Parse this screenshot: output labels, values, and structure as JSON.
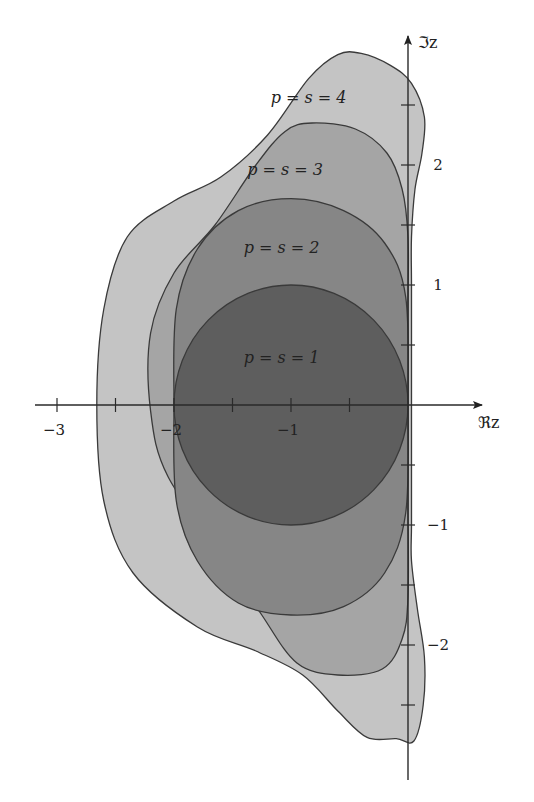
{
  "chart_data": {
    "type": "area",
    "title": "",
    "xlabel": "ℜz",
    "ylabel": "ℑz",
    "xlim": [
      -3.2,
      1.0
    ],
    "ylim": [
      -3.1,
      3.1
    ],
    "x_ticks": [
      -3,
      -2.5,
      -2,
      -1.5,
      -1,
      -0.5,
      0
    ],
    "x_tick_labels": [
      {
        "value": -3,
        "label": "−3"
      },
      {
        "value": -2,
        "label": "−2"
      },
      {
        "value": -1,
        "label": "−1"
      }
    ],
    "y_ticks": [
      -2.5,
      -2,
      -1.5,
      -1,
      -0.5,
      0.5,
      1,
      1.5,
      2,
      2.5
    ],
    "y_tick_labels": [
      {
        "value": 2,
        "label": "2"
      },
      {
        "value": 1,
        "label": "1"
      },
      {
        "value": -1,
        "label": "−1"
      },
      {
        "value": -2,
        "label": "−2"
      }
    ],
    "grid": false,
    "series": [
      {
        "name": "p = s = 4",
        "label": "p = s = 4",
        "fill": "#c4c4c4",
        "label_at": [
          -0.85,
          2.52
        ],
        "outline": [
          [
            -0.4,
            2.93
          ],
          [
            -0.15,
            2.83
          ],
          [
            0.03,
            2.68
          ],
          [
            0.14,
            2.4
          ],
          [
            0.12,
            2.1
          ],
          [
            0.06,
            1.8
          ],
          [
            0.03,
            1.4
          ],
          [
            0.03,
            1.0
          ],
          [
            0.03,
            0.4
          ],
          [
            0.03,
            -0.4
          ],
          [
            0.03,
            -1.0
          ],
          [
            0.03,
            -1.3
          ],
          [
            0.08,
            -1.7
          ],
          [
            0.14,
            -2.1
          ],
          [
            0.13,
            -2.5
          ],
          [
            0.05,
            -2.8
          ],
          [
            -0.1,
            -2.78
          ],
          [
            -0.35,
            -2.77
          ],
          [
            -0.6,
            -2.55
          ],
          [
            -0.9,
            -2.25
          ],
          [
            -1.3,
            -2.05
          ],
          [
            -1.8,
            -1.85
          ],
          [
            -2.35,
            -1.4
          ],
          [
            -2.6,
            -0.8
          ],
          [
            -2.66,
            0.0
          ],
          [
            -2.6,
            0.8
          ],
          [
            -2.4,
            1.4
          ],
          [
            -2.0,
            1.7
          ],
          [
            -1.6,
            1.9
          ],
          [
            -1.2,
            2.25
          ],
          [
            -0.85,
            2.72
          ],
          [
            -0.6,
            2.92
          ]
        ]
      },
      {
        "name": "p = s = 3",
        "label": "p = s = 3",
        "fill": "#a5a5a5",
        "label_at": [
          -1.05,
          1.92
        ],
        "outline": [
          [
            -0.82,
            2.35
          ],
          [
            -0.45,
            2.3
          ],
          [
            -0.18,
            2.1
          ],
          [
            -0.05,
            1.8
          ],
          [
            0.0,
            1.4
          ],
          [
            0.0,
            0.8
          ],
          [
            0.0,
            0.0
          ],
          [
            0.0,
            -0.8
          ],
          [
            0.0,
            -1.6
          ],
          [
            -0.05,
            -1.95
          ],
          [
            -0.22,
            -2.2
          ],
          [
            -0.6,
            -2.25
          ],
          [
            -0.95,
            -2.15
          ],
          [
            -1.25,
            -1.75
          ],
          [
            -1.55,
            -1.3
          ],
          [
            -2.05,
            -0.6
          ],
          [
            -2.2,
            -0.05
          ],
          [
            -2.2,
            0.6
          ],
          [
            -2.0,
            1.1
          ],
          [
            -1.65,
            1.5
          ],
          [
            -1.3,
            2.0
          ],
          [
            -1.05,
            2.28
          ]
        ]
      },
      {
        "name": "p = s = 2",
        "label": "p = s = 2",
        "fill": "#868686",
        "label_at": [
          -1.08,
          1.27
        ],
        "outline": [
          [
            -1.0,
            1.72
          ],
          [
            -0.55,
            1.62
          ],
          [
            -0.2,
            1.35
          ],
          [
            -0.02,
            0.9
          ],
          [
            0.0,
            0.0
          ],
          [
            -0.02,
            -0.9
          ],
          [
            -0.2,
            -1.4
          ],
          [
            -0.55,
            -1.68
          ],
          [
            -1.0,
            -1.75
          ],
          [
            -1.45,
            -1.65
          ],
          [
            -1.8,
            -1.3
          ],
          [
            -1.98,
            -0.8
          ],
          [
            -2.0,
            0.0
          ],
          [
            -1.98,
            0.8
          ],
          [
            -1.8,
            1.3
          ],
          [
            -1.45,
            1.62
          ]
        ]
      },
      {
        "name": "p = s = 1",
        "label": "p = s = 1",
        "fill": "#5e5e5e",
        "label_at": [
          -1.08,
          0.35
        ],
        "circle": {
          "center": [
            -1,
            0
          ],
          "radius": 1
        }
      }
    ]
  }
}
